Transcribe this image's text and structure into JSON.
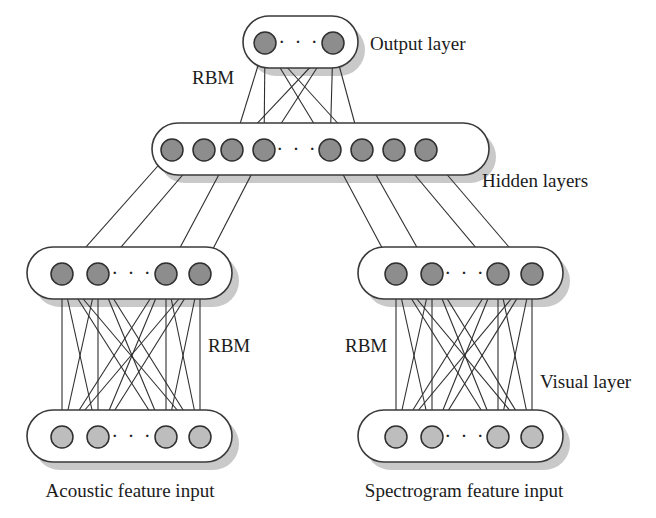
{
  "figure": {
    "type": "neural-network-diagram",
    "background_color": "#ffffff",
    "node_dark_color": "#8d8d8d",
    "node_light_color": "#bdbdbd",
    "edge_color": "#2f2f2f",
    "box_stroke_color": "#3a3a3a",
    "shadow_color": "#c9c9c9"
  },
  "ellipsis": {
    "glyph": "· · ·"
  },
  "labels": {
    "output_layer": "Output layer",
    "hidden_layers": "Hidden layers",
    "visual_layer": "Visual layer",
    "rbm_top": "RBM",
    "rbm_left": "RBM",
    "rbm_right": "RBM",
    "acoustic_input": "Acoustic feature input",
    "spectrogram_input": "Spectrogram feature input"
  },
  "layers": [
    {
      "id": "output",
      "name": "Output layer",
      "role": "output",
      "node_count_shown": 2,
      "node_style": "dark",
      "has_ellipsis": true,
      "box": {
        "x": 243,
        "y": 16,
        "width": 115,
        "height": 52
      },
      "nodes_x": [
        265,
        333
      ],
      "nodes_y": 43,
      "node_radius": 11
    },
    {
      "id": "hidden-top",
      "name": "Hidden layer (joint)",
      "role": "hidden",
      "node_count_shown": 8,
      "node_style": "dark",
      "has_ellipsis": true,
      "box": {
        "x": 152,
        "y": 123,
        "width": 337,
        "height": 52
      },
      "nodes_x": [
        172,
        204,
        232,
        264,
        330,
        362,
        394,
        426
      ],
      "nodes_y": 150,
      "node_radius": 11
    },
    {
      "id": "hidden-left",
      "name": "Hidden layer (acoustic)",
      "role": "hidden",
      "node_count_shown": 4,
      "node_style": "dark",
      "has_ellipsis": true,
      "box": {
        "x": 27,
        "y": 247,
        "width": 205,
        "height": 52
      },
      "nodes_x": [
        62,
        98,
        166,
        200
      ],
      "nodes_y": 274,
      "node_radius": 11
    },
    {
      "id": "hidden-right",
      "name": "Hidden layer (spectrogram)",
      "role": "hidden",
      "node_count_shown": 4,
      "node_style": "dark",
      "has_ellipsis": true,
      "box": {
        "x": 358,
        "y": 247,
        "width": 205,
        "height": 52
      },
      "nodes_x": [
        396,
        432,
        498,
        532
      ],
      "nodes_y": 274,
      "node_radius": 11
    },
    {
      "id": "visible-left",
      "name": "Acoustic feature input layer",
      "role": "visible",
      "node_count_shown": 4,
      "node_style": "light",
      "has_ellipsis": true,
      "box": {
        "x": 27,
        "y": 410,
        "width": 205,
        "height": 52
      },
      "nodes_x": [
        62,
        98,
        166,
        200
      ],
      "nodes_y": 437,
      "node_radius": 11
    },
    {
      "id": "visible-right",
      "name": "Spectrogram feature input layer",
      "role": "visible",
      "node_count_shown": 4,
      "node_style": "light",
      "has_ellipsis": true,
      "box": {
        "x": 358,
        "y": 410,
        "width": 205,
        "height": 52
      },
      "nodes_x": [
        396,
        432,
        498,
        532
      ],
      "nodes_y": 437,
      "node_radius": 11
    }
  ],
  "connections": [
    {
      "id": "output-to-hidden-top",
      "from_layer": "output",
      "to_layer": "hidden-top",
      "pattern": "fully-connected",
      "from_nodes_x": [
        265,
        333
      ],
      "to_nodes_x": [
        232,
        264,
        330,
        362
      ],
      "edge_count": 8
    },
    {
      "id": "hidden-top-to-hidden-left",
      "from_layer": "hidden-top",
      "to_layer": "hidden-left",
      "pattern": "one-to-one",
      "from_nodes_x": [
        172,
        204,
        232,
        264
      ],
      "to_nodes_x": [
        62,
        98,
        166,
        200
      ],
      "edge_count": 4
    },
    {
      "id": "hidden-top-to-hidden-right",
      "from_layer": "hidden-top",
      "to_layer": "hidden-right",
      "pattern": "one-to-one",
      "from_nodes_x": [
        330,
        362,
        394,
        426
      ],
      "to_nodes_x": [
        396,
        432,
        498,
        532
      ],
      "edge_count": 4
    },
    {
      "id": "hidden-left-to-visible-left",
      "from_layer": "hidden-left",
      "to_layer": "visible-left",
      "pattern": "fully-connected",
      "from_nodes_x": [
        62,
        98,
        166,
        200
      ],
      "to_nodes_x": [
        62,
        98,
        166,
        200
      ],
      "edge_count": 16
    },
    {
      "id": "hidden-right-to-visible-right",
      "from_layer": "hidden-right",
      "to_layer": "visible-right",
      "pattern": "fully-connected",
      "from_nodes_x": [
        396,
        432,
        498,
        532
      ],
      "to_nodes_x": [
        396,
        432,
        498,
        532
      ],
      "edge_count": 16
    }
  ],
  "annotations": [
    {
      "id": "rbm-top",
      "text": "RBM",
      "x": 192,
      "y": 84,
      "anchor": "start"
    },
    {
      "id": "output-layer",
      "text": "Output layer",
      "x": 370,
      "y": 50,
      "anchor": "start"
    },
    {
      "id": "hidden-layers",
      "text": "Hidden layers",
      "x": 482,
      "y": 187,
      "anchor": "start"
    },
    {
      "id": "rbm-left",
      "text": "RBM",
      "x": 208,
      "y": 352,
      "anchor": "start"
    },
    {
      "id": "rbm-right",
      "text": "RBM",
      "x": 345,
      "y": 352,
      "anchor": "start"
    },
    {
      "id": "visual-layer",
      "text": "Visual layer",
      "x": 540,
      "y": 388,
      "anchor": "start"
    },
    {
      "id": "acoustic-caption",
      "text": "Acoustic feature input",
      "x": 130,
      "y": 497,
      "anchor": "middle"
    },
    {
      "id": "spectrogram-caption",
      "text": "Spectrogram feature input",
      "x": 464,
      "y": 497,
      "anchor": "middle"
    }
  ]
}
